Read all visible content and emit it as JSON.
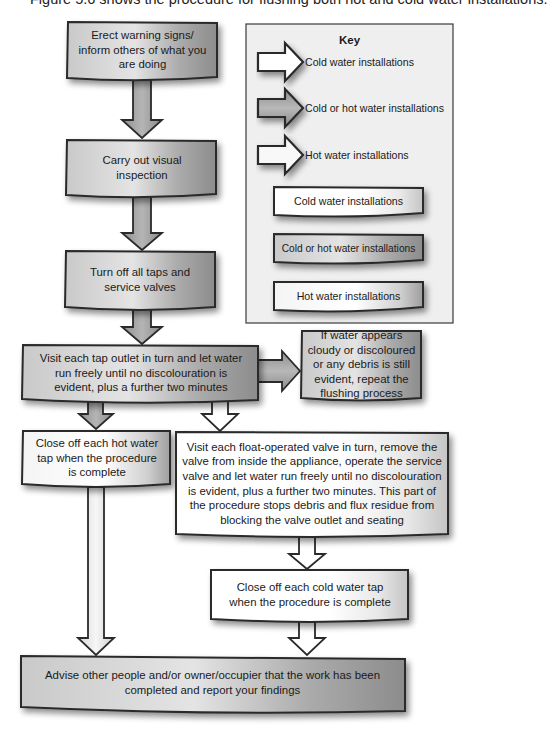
{
  "caption": "Figure 5.6 shows the procedure for flushing both hot and cold water installations.",
  "colors": {
    "cold": "#ffffff",
    "cold_or_hot": "#9a9a9a",
    "hot": "#ffffff",
    "outline": "#2a2a2a",
    "key_background": "#f0f0f0"
  },
  "flowchart": {
    "steps": [
      {
        "id": "step-1",
        "type": "cold_or_hot",
        "text": "Erect warning signs/ inform others of what you are doing"
      },
      {
        "id": "step-2",
        "type": "cold_or_hot",
        "text": "Carry out visual inspection"
      },
      {
        "id": "step-3",
        "type": "cold_or_hot",
        "text": "Turn off all taps and service valves"
      },
      {
        "id": "step-4",
        "type": "cold_or_hot",
        "text": "Visit each tap outlet in turn and let water run freely until no discolouration is evident, plus a further two minutes"
      },
      {
        "id": "step-5",
        "type": "cold_or_hot",
        "text": "If water appears cloudy or discoloured or any debris is still evident, repeat the flushing process"
      },
      {
        "id": "step-6",
        "type": "hot",
        "text": "Close off each hot water tap when the procedure is complete"
      },
      {
        "id": "step-7",
        "type": "cold",
        "text": "Visit each float-operated valve in turn, remove the valve from inside the appliance, operate the service valve and let water run freely until no discolouration is evident, plus a further two minutes. This part of the procedure stops debris and flux residue from blocking the valve outlet and seating"
      },
      {
        "id": "step-8",
        "type": "cold",
        "text": "Close off each cold water tap when the procedure is complete"
      },
      {
        "id": "step-9",
        "type": "cold_or_hot",
        "text": "Advise other people and/or owner/occupier that the work has been completed and report your findings"
      }
    ],
    "connections": [
      {
        "from": "step-1",
        "to": "step-2",
        "type": "cold_or_hot"
      },
      {
        "from": "step-2",
        "to": "step-3",
        "type": "cold_or_hot"
      },
      {
        "from": "step-3",
        "to": "step-4",
        "type": "cold_or_hot"
      },
      {
        "from": "step-4",
        "to": "step-5",
        "type": "cold_or_hot"
      },
      {
        "from": "step-4",
        "to": "step-6",
        "type": "hot"
      },
      {
        "from": "step-4",
        "to": "step-7",
        "type": "cold"
      },
      {
        "from": "step-6",
        "to": "step-9",
        "type": "hot"
      },
      {
        "from": "step-7",
        "to": "step-8",
        "type": "cold"
      },
      {
        "from": "step-8",
        "to": "step-9",
        "type": "cold"
      }
    ]
  },
  "key": {
    "title": "Key",
    "arrows": [
      {
        "type": "cold",
        "label": "Cold water installations"
      },
      {
        "type": "cold_or_hot",
        "label": "Cold or hot water installations"
      },
      {
        "type": "hot",
        "label": "Hot water installations"
      }
    ],
    "boxes": [
      {
        "type": "cold",
        "label": "Cold water installations"
      },
      {
        "type": "cold_or_hot",
        "label": "Cold or hot water installations"
      },
      {
        "type": "hot",
        "label": "Hot water installations"
      }
    ]
  }
}
